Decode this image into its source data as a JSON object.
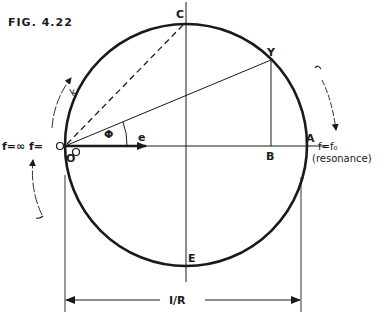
{
  "figure": {
    "title": "FIG. 4.22",
    "labels": {
      "C": "C",
      "Y": "Y",
      "O": "O",
      "A": "A",
      "B": "B",
      "E": "E",
      "phi": "Φ",
      "e": "e",
      "k": "k"
    },
    "annotations": {
      "left_frequency": "f=∞ f=",
      "left_zero": "O",
      "right_frequency": "f=f₀",
      "right_note": "(resonance)",
      "dimension": "I/R"
    },
    "colors": {
      "ink": "#1a1a1a",
      "background": "#ffffff"
    }
  }
}
